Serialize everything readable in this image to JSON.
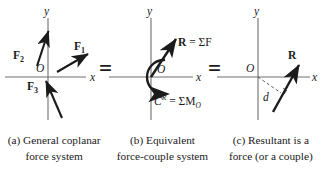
{
  "figure": {
    "background": "#ffffff",
    "ink": "#1b1b1b",
    "axis_color": "#6e6e6e",
    "equals_1": "=",
    "equals_2": "="
  },
  "panels": [
    {
      "id": "a",
      "axis_x_label": "x",
      "axis_y_label": "y",
      "origin_label": "O",
      "forces": [
        {
          "name": "F1",
          "label": "F",
          "sub": "1"
        },
        {
          "name": "F2",
          "label": "F",
          "sub": "2"
        },
        {
          "name": "F3",
          "label": "F",
          "sub": "3"
        }
      ]
    },
    {
      "id": "b",
      "axis_x_label": "x",
      "axis_y_label": "y",
      "origin_label": "O",
      "resultant_label": "R",
      "resultant_equation": " = ΣF",
      "couple_symbol": "C",
      "couple_sup": "R",
      "couple_equation": " = ΣM",
      "couple_sub": "O"
    },
    {
      "id": "c",
      "axis_x_label": "x",
      "axis_y_label": "y",
      "origin_label": "O",
      "resultant_label": "R",
      "distance_label": "d"
    }
  ],
  "captions": [
    {
      "line1": "(a) General coplanar",
      "line2": "force system"
    },
    {
      "line1": "(b) Equivalent",
      "line2": "force-couple system"
    },
    {
      "line1": "(c) Resultant is a",
      "line2": "force (or a couple)"
    }
  ]
}
